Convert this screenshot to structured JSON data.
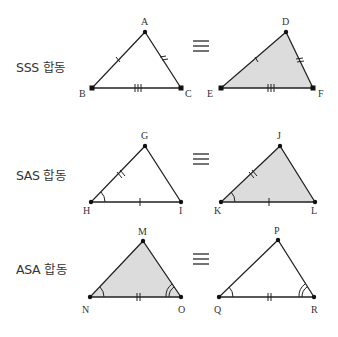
{
  "rows": [
    {
      "label": "SSS 합동",
      "equiv_symbol": "≡",
      "left": {
        "vertices": [
          "A",
          "B",
          "C"
        ],
        "shaded": false
      },
      "right": {
        "vertices": [
          "D",
          "E",
          "F"
        ],
        "shaded": true
      }
    },
    {
      "label": "SAS 합동",
      "equiv_symbol": "≡",
      "left": {
        "vertices": [
          "G",
          "H",
          "I"
        ],
        "shaded": false
      },
      "right": {
        "vertices": [
          "J",
          "K",
          "L"
        ],
        "shaded": true
      }
    },
    {
      "label": "ASA 합동",
      "equiv_symbol": "≡",
      "left": {
        "vertices": [
          "M",
          "N",
          "O"
        ],
        "shaded": true
      },
      "right": {
        "vertices": [
          "P",
          "Q",
          "R"
        ],
        "shaded": false
      }
    }
  ],
  "colors": {
    "stroke": "#222222",
    "fill": "#dcdcdc",
    "text": "#333333"
  }
}
